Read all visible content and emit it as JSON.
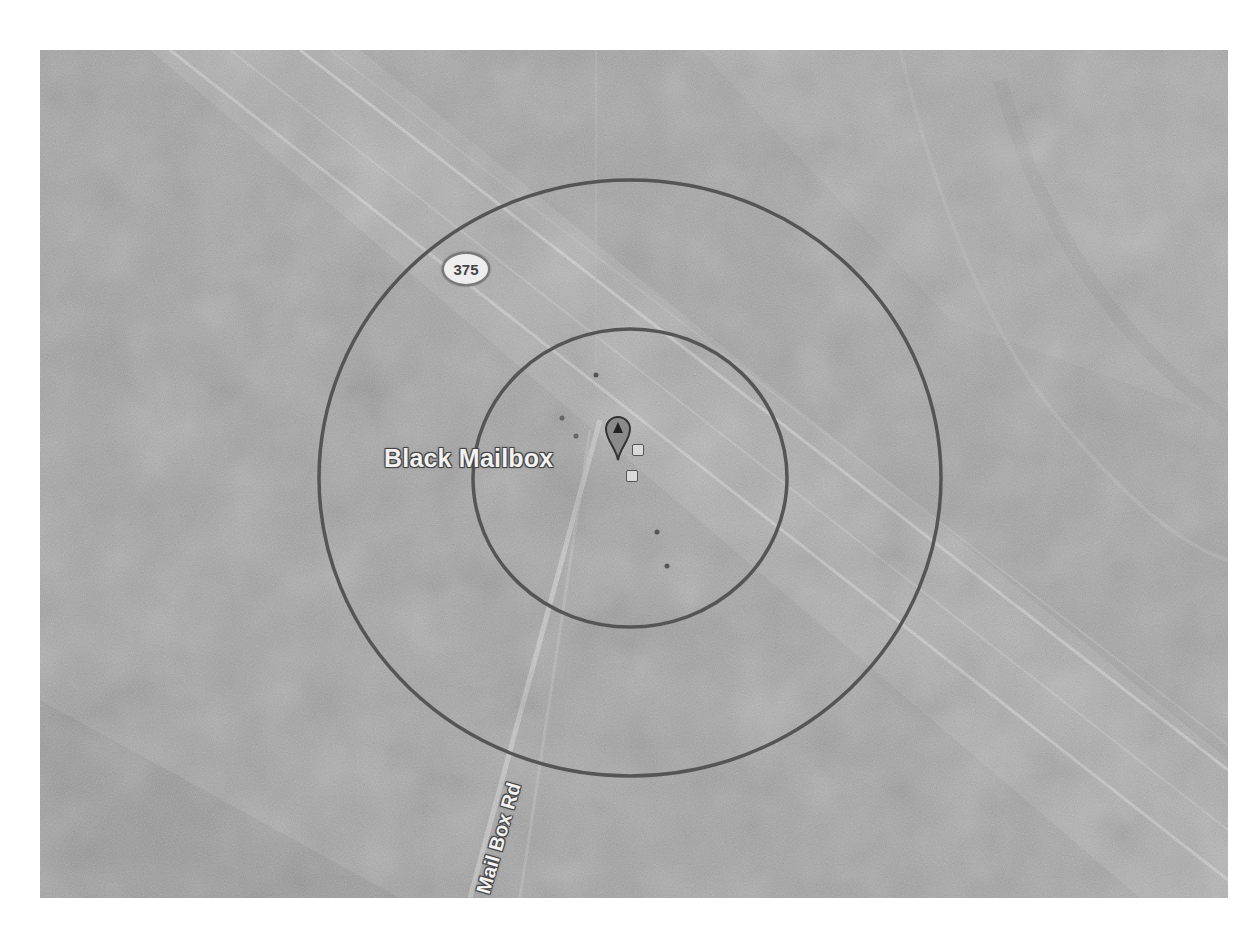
{
  "map": {
    "view": "satellite",
    "colorMode": "grayscale",
    "place_label": "Black Mailbox",
    "road_label": "Mail Box Rd",
    "highway_shield": "375",
    "marker": {
      "letter": "A",
      "icon": "map-pin-icon"
    },
    "range_rings": [
      {
        "name": "inner",
        "cx": 630,
        "cy": 478,
        "rx": 157,
        "ry": 149
      },
      {
        "name": "outer",
        "cx": 630,
        "cy": 478,
        "rx": 311,
        "ry": 298
      }
    ],
    "colors": {
      "ring": "#555555",
      "terrain": "#9c9c9c",
      "road": "#c8c8c8",
      "label_fill": "#f2f2f2",
      "label_stroke": "#444444"
    }
  }
}
